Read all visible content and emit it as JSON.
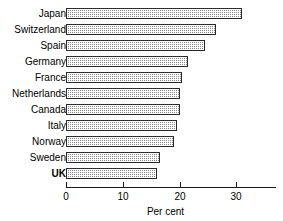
{
  "chart_data": {
    "type": "bar",
    "orientation": "horizontal",
    "title": "",
    "subtitle": "",
    "xlabel": "Per cent",
    "ylabel": "",
    "categories": [
      "Japan",
      "Switzerland",
      "Spain",
      "Germany",
      "France",
      "Netherlands",
      "Canada",
      "Italy",
      "Norway",
      "Sweden",
      "UK"
    ],
    "values": [
      31.0,
      26.5,
      24.5,
      21.5,
      20.5,
      20.0,
      20.0,
      19.5,
      19.0,
      16.5,
      16.0
    ],
    "series": [
      {
        "name": "Per cent",
        "values": [
          31.0,
          26.5,
          24.5,
          21.5,
          20.5,
          20.0,
          20.0,
          19.5,
          19.0,
          16.5,
          16.0
        ]
      }
    ],
    "xlim": [
      0,
      37
    ],
    "ylim": null,
    "xticks": [
      0,
      10,
      20,
      30
    ],
    "xticklabels": [
      "0",
      "10",
      "20",
      "30"
    ],
    "grid": false,
    "legend": false,
    "legend_position": "none",
    "bar_fill": "#8a8a8a",
    "bar_pattern": "checkered-dither",
    "bar_edge_color": "#2b2b2b",
    "axis_color": "#1a1a1a",
    "highlighted_category": "UK",
    "annotations": []
  },
  "axis": {
    "title": "Per cent",
    "ticks": [
      {
        "label": "0",
        "value": 0
      },
      {
        "label": "10",
        "value": 10
      },
      {
        "label": "20",
        "value": 20
      },
      {
        "label": "30",
        "value": 30
      }
    ]
  }
}
